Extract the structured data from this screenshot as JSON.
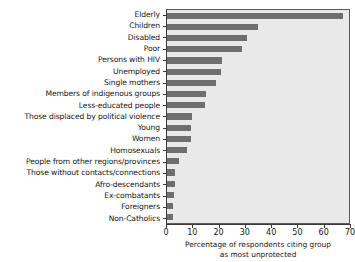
{
  "chart_data": {
    "type": "bar",
    "orientation": "horizontal",
    "title": "",
    "xlabel": "Percentage of respondents citing group as most unprotected",
    "xlabel_line1": "Percentage of respondents citing group",
    "xlabel_line2": "as most unprotected",
    "ylabel": "",
    "xlim": [
      0,
      70
    ],
    "xticks": [
      0,
      10,
      20,
      30,
      40,
      50,
      60,
      70
    ],
    "xticklabels": [
      "0",
      "10",
      "20",
      "30",
      "40",
      "50",
      "60",
      "70"
    ],
    "grid": false,
    "legend": null,
    "bar_color": "#6f6f6f",
    "plot_background": "#e9e9e9",
    "categories": [
      "Elderly",
      "Children",
      "Disabled",
      "Poor",
      "Persons with HIV",
      "Unemployed",
      "Single mothers",
      "Members of indigenous groups",
      "Less-educated people",
      "Those displaced by political violence",
      "Young",
      "Women",
      "Homosexuals",
      "People from other regions/provinces",
      "Those without contacts/connections",
      "Afro-descendants",
      "Ex-combatants",
      "Foreigners",
      "Non-Catholics"
    ],
    "values": [
      67,
      34.5,
      30.5,
      28.5,
      21,
      20.5,
      18.5,
      15,
      14.5,
      9.5,
      9.3,
      9,
      7.5,
      4.5,
      3.2,
      3,
      2.5,
      2.3,
      2.2
    ]
  }
}
